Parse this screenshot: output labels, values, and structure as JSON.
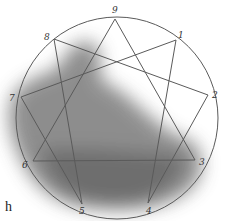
{
  "diagram": {
    "type": "enneagram",
    "circle": {
      "cx": 117,
      "cy": 118,
      "r": 101
    },
    "points": [
      {
        "label": "9",
        "x": 115,
        "y": 19
      },
      {
        "label": "1",
        "x": 176,
        "y": 40
      },
      {
        "label": "2",
        "x": 208,
        "y": 95
      },
      {
        "label": "3",
        "x": 195,
        "y": 160
      },
      {
        "label": "4",
        "x": 148,
        "y": 203
      },
      {
        "label": "5",
        "x": 82,
        "y": 204
      },
      {
        "label": "6",
        "x": 33,
        "y": 161
      },
      {
        "label": "7",
        "x": 21,
        "y": 97
      },
      {
        "label": "8",
        "x": 54,
        "y": 39
      }
    ],
    "triangle": [
      "9",
      "3",
      "6"
    ],
    "hexad": [
      "1",
      "4",
      "2",
      "8",
      "5",
      "7"
    ],
    "label_positions": [
      {
        "label": "9",
        "x": 112,
        "y": 6
      },
      {
        "label": "1",
        "x": 178,
        "y": 31
      },
      {
        "label": "2",
        "x": 212,
        "y": 91
      },
      {
        "label": "3",
        "x": 199,
        "y": 158
      },
      {
        "label": "4",
        "x": 146,
        "y": 207
      },
      {
        "label": "5",
        "x": 79,
        "y": 207
      },
      {
        "label": "6",
        "x": 22,
        "y": 161
      },
      {
        "label": "7",
        "x": 9,
        "y": 94
      },
      {
        "label": "8",
        "x": 44,
        "y": 33
      }
    ],
    "stray_text": "h",
    "line_color": "#5a5a5a",
    "shadow_color": "#6e6e6e"
  }
}
